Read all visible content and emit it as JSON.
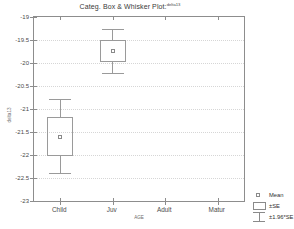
{
  "chart_data": {
    "type": "box",
    "title": "Categ. Box & Whisker Plot:",
    "title_superscript": "delta13",
    "xlabel": "AGE",
    "ylabel": "delta13",
    "categories": [
      "Child",
      "Juv",
      "Adult",
      "Matur"
    ],
    "ylim": [
      -23,
      -19
    ],
    "ytick_step": 0.5,
    "ytick_labels": [
      "-19",
      "-19.5",
      "-20",
      "-20.5",
      "-21",
      "-21.5",
      "-22",
      "-22.5",
      "-23"
    ],
    "ytick_values": [
      -19,
      -19.5,
      -20,
      -20.5,
      -21,
      -21.5,
      -22,
      -22.5,
      -23
    ],
    "grid": true,
    "legend_position": "bottom-right",
    "series": [
      {
        "category": "Child",
        "mean": -21.6,
        "se_low": -22.02,
        "se_high": -21.18,
        "ci_low": -22.4,
        "ci_high": -20.78,
        "present": true
      },
      {
        "category": "Juv",
        "mean": -19.74,
        "se_low": -19.97,
        "se_high": -19.5,
        "ci_low": -20.22,
        "ci_high": -19.26,
        "present": true
      },
      {
        "category": "Adult",
        "mean": null,
        "se_low": null,
        "se_high": null,
        "ci_low": null,
        "ci_high": null,
        "present": false
      },
      {
        "category": "Matur",
        "mean": null,
        "se_low": null,
        "se_high": null,
        "ci_low": null,
        "ci_high": null,
        "present": false
      }
    ],
    "legend": [
      {
        "symbol": "mean-marker",
        "label": "Mean"
      },
      {
        "symbol": "box-se",
        "label": "±SE"
      },
      {
        "symbol": "whisker-ci",
        "label": "±1.96*SE"
      }
    ]
  },
  "colors": {
    "axis": "#8d8d8d",
    "grid": "#d6d6d6",
    "glyph": "#9a9a9a",
    "text": "#3a3a3a",
    "background": "#ffffff"
  }
}
